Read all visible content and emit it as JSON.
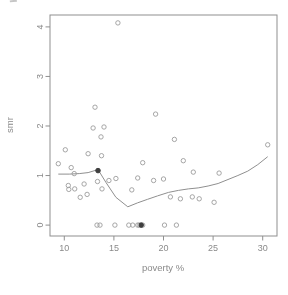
{
  "colors": {
    "background": "#ffffff",
    "frame": "#8f8f8f",
    "tick": "#8f8f8f",
    "text": "#8a8a8a",
    "point_stroke": "#9c9c9c",
    "solid_point": "#3f3f3f",
    "smooth_line": "#8f8f8f"
  },
  "chart_data": {
    "type": "scatter",
    "title": "",
    "xlabel": "poverty %",
    "ylabel": "smr",
    "x_ticks": [
      10,
      15,
      20,
      25,
      30
    ],
    "y_ticks": [
      0,
      1,
      2,
      3,
      4
    ],
    "xlim": [
      8.56,
      31.44
    ],
    "ylim": [
      -0.22,
      4.24
    ],
    "grid": false,
    "legend": "none",
    "series": [
      {
        "name": "observations",
        "marker": "open-circle",
        "points": [
          [
            9.4,
            1.24
          ],
          [
            10.1,
            1.52
          ],
          [
            10.4,
            0.8
          ],
          [
            10.45,
            0.72
          ],
          [
            10.7,
            1.16
          ],
          [
            11.0,
            1.04
          ],
          [
            11.05,
            0.73
          ],
          [
            11.6,
            0.56
          ],
          [
            12.0,
            0.83
          ],
          [
            12.3,
            0.62
          ],
          [
            12.4,
            1.44
          ],
          [
            12.9,
            1.96
          ],
          [
            13.1,
            2.38
          ],
          [
            13.35,
            0.88
          ],
          [
            13.7,
            1.78
          ],
          [
            13.75,
            1.4
          ],
          [
            13.8,
            0.73
          ],
          [
            14.0,
            1.98
          ],
          [
            14.5,
            0.9
          ],
          [
            15.2,
            0.94
          ],
          [
            15.4,
            4.08
          ],
          [
            16.8,
            0.71
          ],
          [
            17.4,
            0.95
          ],
          [
            17.9,
            1.26
          ],
          [
            19.0,
            0.9
          ],
          [
            19.2,
            2.24
          ],
          [
            20.0,
            0.93
          ],
          [
            20.7,
            0.57
          ],
          [
            21.1,
            1.73
          ],
          [
            21.7,
            0.53
          ],
          [
            22.0,
            1.3
          ],
          [
            22.9,
            0.57
          ],
          [
            23.0,
            1.07
          ],
          [
            23.6,
            0.53
          ],
          [
            25.1,
            0.46
          ],
          [
            25.6,
            1.05
          ],
          [
            30.5,
            1.62
          ],
          [
            13.3,
            0
          ],
          [
            13.6,
            0
          ],
          [
            15.1,
            0
          ],
          [
            16.5,
            0
          ],
          [
            16.9,
            0
          ],
          [
            17.4,
            0
          ],
          [
            17.55,
            0
          ],
          [
            17.9,
            0
          ],
          [
            20.1,
            0
          ],
          [
            21.3,
            0
          ]
        ]
      },
      {
        "name": "highlighted-points",
        "marker": "solid-dot",
        "points": [
          [
            13.4,
            1.1
          ],
          [
            17.75,
            0
          ]
        ]
      },
      {
        "name": "lowess-smooth",
        "marker": "line",
        "points": [
          [
            9.4,
            1.03
          ],
          [
            10.5,
            1.03
          ],
          [
            11.5,
            1.04
          ],
          [
            12.4,
            1.06
          ],
          [
            13.4,
            1.12
          ],
          [
            14.2,
            0.86
          ],
          [
            15.2,
            0.56
          ],
          [
            16.4,
            0.37
          ],
          [
            17.4,
            0.45
          ],
          [
            18.4,
            0.52
          ],
          [
            19.4,
            0.59
          ],
          [
            20.5,
            0.66
          ],
          [
            21.5,
            0.7
          ],
          [
            22.5,
            0.73
          ],
          [
            23.5,
            0.75
          ],
          [
            24.5,
            0.79
          ],
          [
            25.5,
            0.84
          ],
          [
            26.5,
            0.92
          ],
          [
            27.5,
            1.0
          ],
          [
            28.5,
            1.09
          ],
          [
            29.5,
            1.22
          ],
          [
            30.5,
            1.38
          ]
        ]
      }
    ]
  }
}
